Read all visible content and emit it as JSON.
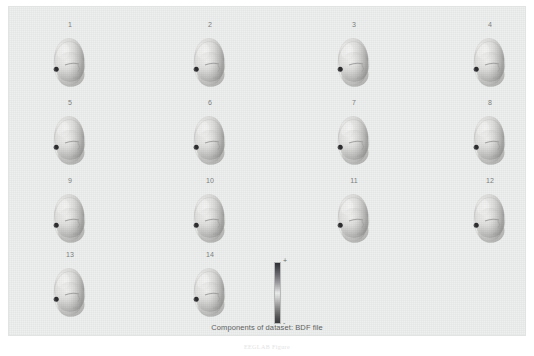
{
  "figure": {
    "caption": "Components of dataset: BDF file",
    "background_color": "#eef0ef",
    "below_caption": "EEGLAB Figure"
  },
  "components": [
    {
      "label": "1",
      "view": "left-oblique-head",
      "x": 18,
      "y": 14
    },
    {
      "label": "2",
      "view": "left-oblique-head",
      "x": 158,
      "y": 14
    },
    {
      "label": "3",
      "view": "left-oblique-head",
      "x": 302,
      "y": 14
    },
    {
      "label": "4",
      "view": "left-oblique-head",
      "x": 438,
      "y": 14
    },
    {
      "label": "5",
      "view": "left-oblique-head",
      "x": 18,
      "y": 92
    },
    {
      "label": "6",
      "view": "left-oblique-head",
      "x": 158,
      "y": 92
    },
    {
      "label": "7",
      "view": "left-oblique-head",
      "x": 302,
      "y": 92
    },
    {
      "label": "8",
      "view": "left-oblique-head",
      "x": 438,
      "y": 92
    },
    {
      "label": "9",
      "view": "left-oblique-head",
      "x": 18,
      "y": 170
    },
    {
      "label": "10",
      "view": "left-oblique-head",
      "x": 158,
      "y": 170
    },
    {
      "label": "11",
      "view": "left-oblique-head",
      "x": 302,
      "y": 170
    },
    {
      "label": "12",
      "view": "left-oblique-head",
      "x": 438,
      "y": 170
    },
    {
      "label": "13",
      "view": "left-oblique-head",
      "x": 18,
      "y": 244
    },
    {
      "label": "14",
      "view": "left-oblique-head",
      "x": 158,
      "y": 244
    }
  ],
  "colorbar": {
    "max_label": "+",
    "min_label": "-",
    "orientation": "vertical",
    "colors_top_to_bottom": [
      "#2f2f35",
      "#9a9a9e",
      "#eceded",
      "#7c7c7c",
      "#3a3a3e"
    ]
  },
  "chart_data": {
    "type": "heatmap",
    "title": "Components of dataset: BDF file",
    "xlabel": "",
    "ylabel": "",
    "grid": false,
    "legend_position": "bottom-center",
    "categories": [
      "1",
      "2",
      "3",
      "4",
      "5",
      "6",
      "7",
      "8",
      "9",
      "10",
      "11",
      "12",
      "13",
      "14"
    ],
    "values": [
      1,
      2,
      3,
      4,
      5,
      6,
      7,
      8,
      9,
      10,
      11,
      12,
      13,
      14
    ],
    "colorbar_range": [
      "-",
      "+"
    ]
  }
}
